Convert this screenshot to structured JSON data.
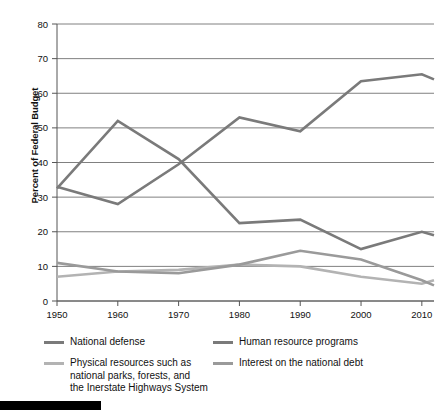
{
  "chart_data": {
    "type": "line",
    "title": "",
    "subtitle": "",
    "xlabel": "",
    "ylabel": "Percent of Federal Budget",
    "x": [
      1950,
      1960,
      1970,
      1980,
      1990,
      2000,
      2010,
      2012
    ],
    "xlim": [
      1950,
      2012
    ],
    "ylim": [
      0,
      80
    ],
    "xticks": [
      1950,
      1960,
      1970,
      1980,
      1990,
      2000,
      2010
    ],
    "xtick_labels": [
      "1950",
      "1960",
      "1970",
      "1980",
      "1990",
      "2000",
      "2010"
    ],
    "yticks": [
      0,
      10,
      20,
      30,
      40,
      50,
      60,
      70,
      80
    ],
    "ytick_labels": [
      "0",
      "10",
      "20",
      "30",
      "40",
      "50",
      "60",
      "70",
      "80"
    ],
    "grid": "horizontal",
    "legend_position": "bottom",
    "series": [
      {
        "name": "National defense",
        "color": "#7a7a7a",
        "values": [
          32.5,
          52.0,
          41.0,
          22.5,
          23.5,
          15.0,
          20.0,
          19.0
        ]
      },
      {
        "name": "Human resource programs",
        "color": "#7a7a7a",
        "values": [
          33.0,
          28.0,
          39.5,
          53.0,
          49.0,
          63.5,
          65.5,
          64.0
        ]
      },
      {
        "name": "Physical resources such as\nnational parks, forests, and\nthe Inerstate Highways System",
        "color": "#b3b3b3",
        "values": [
          7.0,
          8.5,
          9.0,
          10.5,
          10.0,
          7.0,
          5.0,
          6.0
        ]
      },
      {
        "name": "Interest on the national debt",
        "color": "#9a9a9a",
        "values": [
          11.0,
          8.5,
          8.0,
          10.5,
          14.5,
          12.0,
          6.0,
          4.5
        ]
      }
    ]
  },
  "legend": {
    "items": [
      {
        "label": "National defense",
        "color": "#7a7a7a"
      },
      {
        "label": "Human resource programs",
        "color": "#7a7a7a"
      },
      {
        "label": "Physical resources such as\nnational parks, forests, and\nthe Inerstate Highways System",
        "color": "#b3b3b3"
      },
      {
        "label": "Interest on the national debt",
        "color": "#9a9a9a"
      }
    ]
  },
  "axes": {
    "y_title": "Percent of Federal Budget"
  }
}
